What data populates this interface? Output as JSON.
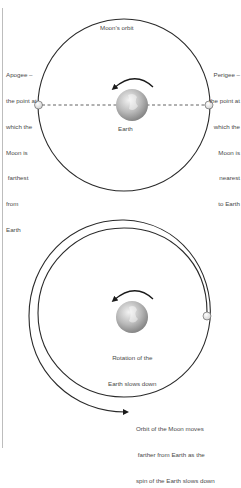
{
  "top_diagram": {
    "orbit_label": "Moon’s orbit",
    "apogee_label": [
      "Apogee –",
      "the point at",
      "which the",
      "Moon is",
      " farthest",
      "from",
      "Earth"
    ],
    "perigee_label": [
      "Perigee –",
      "the point at",
      "which the",
      "Moon is",
      "nearest",
      "to Earth"
    ],
    "earth_label": "Earth"
  },
  "bottom_diagram": {
    "earth_label": [
      "Rotation of the",
      "Earth slows down"
    ],
    "orbit_label": [
      "Orbit of the Moon moves",
      " farther from Earth as the",
      "spin of the Earth slows down"
    ]
  },
  "colors": {
    "line": "#2a2a2a",
    "text": "#4a4a4a",
    "earth_light": "#e6e6e6",
    "earth_dark": "#8a8a8a",
    "moon_fill": "#f4f4f4",
    "edge_rule": "#bdbdbd"
  }
}
